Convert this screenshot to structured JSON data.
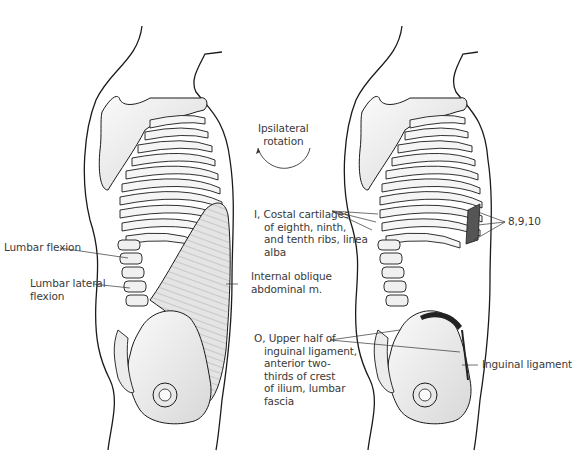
{
  "figure": {
    "type": "anatomical illustration",
    "panels": [
      {
        "id": "left",
        "view": "lateral trunk with muscle"
      },
      {
        "id": "right",
        "view": "lateral trunk skeleton with attachments"
      }
    ]
  },
  "labels": {
    "rotation": [
      "Ipsilateral",
      "rotation"
    ],
    "insertion": [
      "I, Costal cartilages",
      "of eighth, ninth,",
      "and tenth ribs, linea",
      "alba"
    ],
    "muscle": [
      "Internal oblique",
      "abdominal m."
    ],
    "origin": [
      "O, Upper half of",
      "inguinal ligament,",
      "anterior two-",
      "thirds of crest",
      "of ilium, lumbar",
      "fascia"
    ],
    "lumbar_flexion": "Lumbar flexion",
    "lumbar_lateral_flexion": [
      "Lumbar lateral",
      "flexion"
    ],
    "ribs": "8,9,10",
    "inguinal_ligament": "Inguinal ligament"
  },
  "colors": {
    "line": "#1a1a1a",
    "bone_fill": "#f2f2f2",
    "muscle_fill": "#dcdcdc",
    "text": "#3a3a3a"
  }
}
